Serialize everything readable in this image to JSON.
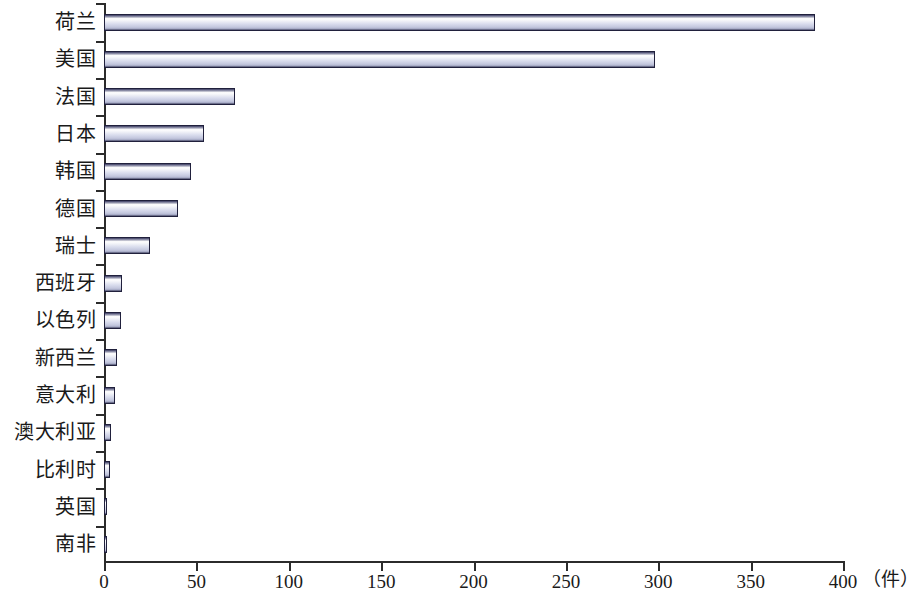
{
  "chart_data": {
    "type": "bar",
    "orientation": "horizontal",
    "title": "",
    "subtitle": "",
    "xlabel": "（件）",
    "ylabel": "",
    "xlim": [
      0,
      400
    ],
    "xticks": [
      "0",
      "50",
      "100",
      "150",
      "200",
      "250",
      "300",
      "350",
      "400"
    ],
    "xtick_values": [
      0,
      50,
      100,
      150,
      200,
      250,
      300,
      350,
      400
    ],
    "grid": false,
    "legend": null,
    "categories": [
      "荷兰",
      "美国",
      "法国",
      "日本",
      "韩国",
      "德国",
      "瑞士",
      "西班牙",
      "以色列",
      "新西兰",
      "意大利",
      "澳大利亚",
      "比利时",
      "英国",
      "南非"
    ],
    "values": [
      385,
      298,
      71,
      54,
      47,
      40,
      25,
      10,
      9,
      7,
      6,
      4,
      3,
      1,
      1
    ],
    "bar_face_color": "#d9dced",
    "bar_edge_color": "#20203c",
    "axis_color": "#2b2b2b",
    "background_color": "#ffffff"
  }
}
